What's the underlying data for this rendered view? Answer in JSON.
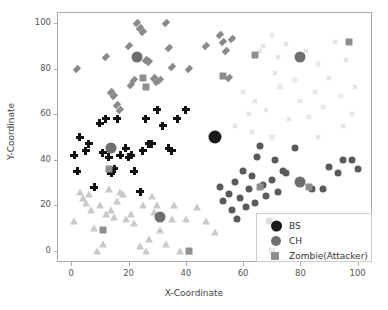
{
  "chart_data": {
    "type": "scatter",
    "title": "",
    "xlabel": "X-Coordinate",
    "ylabel": "Y-Coordinate",
    "xlim": [
      -5,
      105
    ],
    "ylim": [
      -5,
      105
    ],
    "xticks": [
      0,
      20,
      40,
      60,
      80,
      100
    ],
    "yticks": [
      0,
      20,
      40,
      60,
      80,
      100
    ],
    "grid": false,
    "legend_position": "lower right",
    "legend": [
      {
        "label": "BS",
        "marker": "circle",
        "color": "#1a1a1a",
        "size": 11
      },
      {
        "label": "CH",
        "marker": "circle",
        "color": "#6e6e6e",
        "size": 10
      },
      {
        "label": "Zombie(Attacker)",
        "marker": "square",
        "color": "#8e8e8e",
        "size": 8
      }
    ],
    "series": [
      {
        "name": "cluster-1-nodes",
        "marker": "diamond",
        "color": "#8a8a8a",
        "size": 7,
        "points": [
          [
            2,
            80
          ],
          [
            12,
            85
          ],
          [
            14,
            70
          ],
          [
            15,
            68
          ],
          [
            16,
            64
          ],
          [
            17,
            62
          ],
          [
            20,
            90
          ],
          [
            21,
            73
          ],
          [
            22,
            75
          ],
          [
            23,
            100
          ],
          [
            24,
            98
          ],
          [
            25,
            96
          ],
          [
            26,
            84
          ],
          [
            27,
            83
          ],
          [
            29,
            76
          ],
          [
            30,
            74
          ],
          [
            31,
            75
          ],
          [
            33,
            100
          ],
          [
            34,
            89
          ],
          [
            35,
            81
          ],
          [
            41,
            80
          ],
          [
            47,
            90
          ],
          [
            52,
            95
          ],
          [
            53,
            92
          ],
          [
            54,
            88
          ],
          [
            55,
            76
          ],
          [
            56,
            93
          ]
        ]
      },
      {
        "name": "cluster-2-nodes",
        "marker": "plus",
        "color": "#111111",
        "size": 8,
        "points": [
          [
            1,
            42
          ],
          [
            2,
            35
          ],
          [
            3,
            50
          ],
          [
            5,
            44
          ],
          [
            6,
            47
          ],
          [
            8,
            28
          ],
          [
            10,
            56
          ],
          [
            11,
            43
          ],
          [
            12,
            58
          ],
          [
            13,
            41
          ],
          [
            14,
            34
          ],
          [
            15,
            36
          ],
          [
            16,
            58
          ],
          [
            17,
            42
          ],
          [
            19,
            45
          ],
          [
            20,
            41
          ],
          [
            21,
            42
          ],
          [
            22,
            35
          ],
          [
            24,
            26
          ],
          [
            25,
            44
          ],
          [
            26,
            58
          ],
          [
            27,
            47
          ],
          [
            28,
            47
          ],
          [
            30,
            62
          ],
          [
            32,
            55
          ],
          [
            34,
            45
          ],
          [
            35,
            44
          ],
          [
            37,
            58
          ],
          [
            40,
            62
          ]
        ]
      },
      {
        "name": "cluster-3-nodes",
        "marker": "triangle",
        "color": "#c9c9c9",
        "size": 8,
        "points": [
          [
            1,
            13
          ],
          [
            3,
            26
          ],
          [
            4,
            23
          ],
          [
            5,
            21
          ],
          [
            6,
            25
          ],
          [
            7,
            18
          ],
          [
            8,
            10
          ],
          [
            9,
            0
          ],
          [
            10,
            20
          ],
          [
            11,
            3
          ],
          [
            12,
            16
          ],
          [
            13,
            27
          ],
          [
            14,
            18
          ],
          [
            15,
            15
          ],
          [
            16,
            22
          ],
          [
            17,
            26
          ],
          [
            18,
            25
          ],
          [
            19,
            14
          ],
          [
            21,
            16
          ],
          [
            22,
            12
          ],
          [
            24,
            2
          ],
          [
            25,
            20
          ],
          [
            26,
            0
          ],
          [
            27,
            5
          ],
          [
            28,
            24
          ],
          [
            29,
            17
          ],
          [
            30,
            20
          ],
          [
            31,
            9
          ],
          [
            33,
            3
          ],
          [
            35,
            14
          ],
          [
            36,
            20
          ],
          [
            38,
            0
          ],
          [
            40,
            14
          ],
          [
            41,
            0
          ],
          [
            44,
            19
          ],
          [
            47,
            13
          ],
          [
            50,
            8
          ]
        ]
      },
      {
        "name": "cluster-4-nodes",
        "marker": "circle",
        "color": "#5a5a5a",
        "size": 7,
        "points": [
          [
            52,
            28
          ],
          [
            53,
            22
          ],
          [
            55,
            25
          ],
          [
            56,
            18
          ],
          [
            57,
            30
          ],
          [
            58,
            14
          ],
          [
            59,
            23
          ],
          [
            60,
            35
          ],
          [
            61,
            19
          ],
          [
            62,
            27
          ],
          [
            63,
            33
          ],
          [
            64,
            21
          ],
          [
            65,
            41
          ],
          [
            66,
            46
          ],
          [
            67,
            29
          ],
          [
            68,
            24
          ],
          [
            69,
            13
          ],
          [
            70,
            31
          ],
          [
            71,
            40
          ],
          [
            72,
            26
          ],
          [
            74,
            35
          ],
          [
            75,
            34
          ],
          [
            78,
            45
          ],
          [
            80,
            30
          ],
          [
            84,
            27
          ],
          [
            88,
            27
          ],
          [
            90,
            37
          ],
          [
            93,
            34
          ],
          [
            95,
            40
          ],
          [
            98,
            40
          ],
          [
            100,
            36
          ]
        ]
      },
      {
        "name": "cluster-5-nodes",
        "marker": "x",
        "color": "#e3e3e3",
        "size": 6,
        "points": [
          [
            60,
            70
          ],
          [
            62,
            60
          ],
          [
            64,
            66
          ],
          [
            66,
            88
          ],
          [
            67,
            90
          ],
          [
            68,
            62
          ],
          [
            70,
            95
          ],
          [
            71,
            78
          ],
          [
            72,
            85
          ],
          [
            73,
            72
          ],
          [
            75,
            91
          ],
          [
            76,
            58
          ],
          [
            78,
            75
          ],
          [
            80,
            66
          ],
          [
            82,
            88
          ],
          [
            83,
            59
          ],
          [
            85,
            70
          ],
          [
            86,
            82
          ],
          [
            88,
            63
          ],
          [
            90,
            76
          ],
          [
            92,
            92
          ],
          [
            94,
            68
          ],
          [
            96,
            84
          ],
          [
            98,
            60
          ],
          [
            99,
            72
          ],
          [
            57,
            55
          ],
          [
            63,
            52
          ],
          [
            70,
            50
          ],
          [
            86,
            50
          ],
          [
            95,
            55
          ]
        ]
      },
      {
        "name": "cluster-heads",
        "marker": "circle",
        "color": "#6e6e6e",
        "size": 11,
        "points": [
          [
            23,
            85
          ],
          [
            14,
            45
          ],
          [
            31,
            15
          ],
          [
            80,
            30
          ],
          [
            80,
            85
          ]
        ]
      },
      {
        "name": "base-station",
        "marker": "circle",
        "color": "#1a1a1a",
        "size": 13,
        "points": [
          [
            50,
            50
          ]
        ]
      },
      {
        "name": "zombie-attackers",
        "marker": "square",
        "color": "#8e8e8e",
        "size": 7,
        "points": [
          [
            25,
            76
          ],
          [
            26,
            72
          ],
          [
            13,
            36
          ],
          [
            11,
            9
          ],
          [
            41,
            0
          ],
          [
            53,
            77
          ],
          [
            64,
            86
          ],
          [
            66,
            28
          ],
          [
            83,
            28
          ],
          [
            97,
            92
          ],
          [
            70,
            0
          ]
        ]
      }
    ]
  }
}
